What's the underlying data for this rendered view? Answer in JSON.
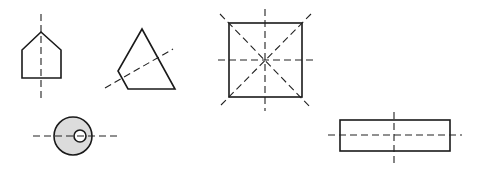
{
  "figure": {
    "colors": {
      "stroke": "#1a1a1a",
      "axis": "#222222",
      "fill_disc": "#dcdcdc",
      "hole": "#ffffff",
      "background": "#ffffff"
    },
    "shapes": [
      {
        "id": "pentagon",
        "name": "house-shaped pentagon",
        "points": "41,32 61,50 61,78 22,78 22,50",
        "axes": [
          {
            "x1": 41,
            "y1": 14,
            "x2": 41,
            "y2": 100
          }
        ]
      },
      {
        "id": "kite",
        "name": "kite quadrilateral",
        "points": "142,29 175,89 128,89 118,71",
        "axes": [
          {
            "x1": 105,
            "y1": 88,
            "x2": 173,
            "y2": 49
          }
        ]
      },
      {
        "id": "square",
        "name": "square",
        "rect": {
          "x": 229,
          "y": 23,
          "w": 73,
          "h": 74
        },
        "axes": [
          {
            "x1": 265,
            "y1": 9,
            "x2": 265,
            "y2": 111
          },
          {
            "x1": 218,
            "y1": 60,
            "x2": 314,
            "y2": 60
          },
          {
            "x1": 220,
            "y1": 14,
            "x2": 311,
            "y2": 108
          },
          {
            "x1": 311,
            "y1": 14,
            "x2": 220,
            "y2": 106
          }
        ]
      },
      {
        "id": "ring",
        "name": "disc with off-center hole",
        "outer": {
          "cx": 73,
          "cy": 136,
          "r": 19
        },
        "inner": {
          "cx": 80,
          "cy": 136,
          "r": 6
        },
        "axes": [
          {
            "x1": 33,
            "y1": 136,
            "x2": 120,
            "y2": 136
          }
        ]
      },
      {
        "id": "rectangle",
        "name": "rectangle",
        "rect": {
          "x": 340,
          "y": 120,
          "w": 110,
          "h": 31
        },
        "axes": [
          {
            "x1": 328,
            "y1": 135,
            "x2": 462,
            "y2": 135
          },
          {
            "x1": 394,
            "y1": 112,
            "x2": 394,
            "y2": 165
          }
        ]
      }
    ]
  }
}
